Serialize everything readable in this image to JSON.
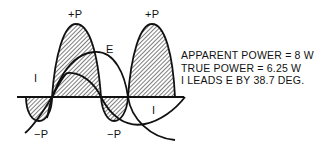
{
  "diagram": {
    "title": "",
    "labels": {
      "pos_p_1": "+P",
      "pos_p_2": "+P",
      "neg_p_1": "−P",
      "neg_p_2": "−P",
      "e_label": "E",
      "i_label_1": "I",
      "i_label_2": "I"
    },
    "info_lines": [
      "APPARENT POWER = 8 W",
      "TRUE POWER = 6.25 W",
      "I LEADS E BY 38.7 DEG."
    ],
    "colors": {
      "line": "#111111",
      "background": "#ffffff"
    }
  }
}
